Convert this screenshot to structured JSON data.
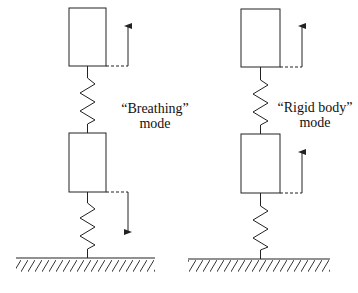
{
  "diagrams": [
    {
      "id": "breathing",
      "label_line1": "“Breathing”",
      "label_line2": "mode",
      "top_arrow": "up",
      "bottom_arrow": "down"
    },
    {
      "id": "rigid",
      "label_line1": "“Rigid body”",
      "label_line2": "mode",
      "top_arrow": "up",
      "bottom_arrow": "up"
    }
  ],
  "colors": {
    "stroke": "#222222",
    "background": "#ffffff"
  }
}
